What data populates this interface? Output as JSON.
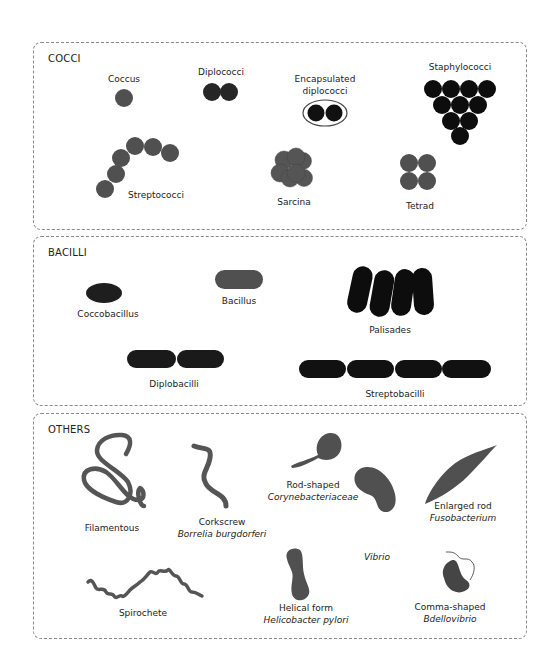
{
  "colors": {
    "medium": "#505050",
    "dark": "#262626",
    "black": "#0d0d0d",
    "border": "#888888"
  },
  "panels": [
    {
      "id": "cocci",
      "title": "COCCI"
    },
    {
      "id": "bacilli",
      "title": "BACILLI"
    },
    {
      "id": "others",
      "title": "OTHERS"
    }
  ],
  "cocci": {
    "coccus": "Coccus",
    "diplococci": "Diplococci",
    "encapsulated_1": "Encapsulated",
    "encapsulated_2": "diplococci",
    "staphylococci": "Staphylococci",
    "streptococci": "Streptococci",
    "sarcina": "Sarcina",
    "tetrad": "Tetrad"
  },
  "bacilli": {
    "coccobacillus": "Coccobacillus",
    "bacillus": "Bacillus",
    "palisades": "Palisades",
    "diplobacilli": "Diplobacilli",
    "streptobacilli": "Streptobacilli"
  },
  "others": {
    "filamentous": "Filamentous",
    "corkscrew": "Corkscrew",
    "corkscrew_species": "Borrelia burgdorferi",
    "rod_shaped": "Rod-shaped",
    "rod_shaped_species": "Corynebacteriaceae",
    "enlarged_rod": "Enlarged rod",
    "enlarged_rod_species": "Fusobacterium",
    "vibrio": "Vibrio",
    "spirochete": "Spirochete",
    "helical_form": "Helical form",
    "helical_form_species": "Helicobacter pylori",
    "comma_shaped": "Comma-shaped",
    "comma_shaped_species": "Bdellovibrio"
  }
}
